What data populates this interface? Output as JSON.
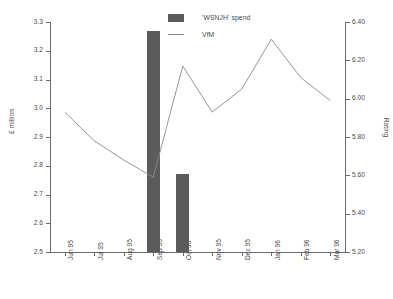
{
  "chart_data": {
    "type": "bar",
    "title": "",
    "subtitle": "",
    "categories": [
      "Jun 95",
      "Jul 95",
      "Aug 95",
      "Sep 95",
      "Oct 95",
      "Nov 95",
      "Dec 95",
      "Jan 96",
      "Feb 96",
      "Mar 96"
    ],
    "xlabel": "",
    "ylabel": "£ million",
    "ylabel_secondary": "Rating",
    "ylim": [
      2.5,
      3.3
    ],
    "ylim_secondary": [
      5.2,
      6.4
    ],
    "yticks": [
      "2.5",
      "2.6",
      "2.7",
      "2.8",
      "2.9",
      "3.0",
      "3.1",
      "3.2",
      "3.3"
    ],
    "ytick_values": [
      2.5,
      2.6,
      2.7,
      2.8,
      2.9,
      3.0,
      3.1,
      3.2,
      3.3
    ],
    "yticks_secondary": [
      "5.20",
      "5.40",
      "5.60",
      "5.80",
      "6.00",
      "6.20",
      "6.40"
    ],
    "ytick_values_secondary": [
      5.2,
      5.4,
      5.6,
      5.8,
      6.0,
      6.2,
      6.4
    ],
    "grid": false,
    "legend_position": "top-center",
    "series": [
      {
        "name": "'WSNJH' spend",
        "type": "bar",
        "axis": "left",
        "color": "#5b5b5b",
        "values": [
          null,
          null,
          null,
          3.27,
          2.77,
          null,
          null,
          null,
          null,
          null
        ]
      },
      {
        "name": "VfM",
        "type": "line",
        "axis": "right",
        "color": "#8a8a8a",
        "values": [
          5.93,
          5.78,
          5.68,
          5.59,
          6.17,
          5.93,
          6.05,
          6.31,
          6.11,
          5.99
        ]
      }
    ],
    "annotations": []
  },
  "legend": {
    "items": [
      {
        "label": "'WSNJH' spend",
        "marker": "bar-swatch"
      },
      {
        "label": "VfM",
        "marker": "line-swatch"
      }
    ]
  },
  "colors": {
    "bar": "#5b5b5b",
    "line": "#8a8a8a",
    "axis": "#6b6b6b",
    "text": "#4a4a4a",
    "background": "#ffffff"
  }
}
